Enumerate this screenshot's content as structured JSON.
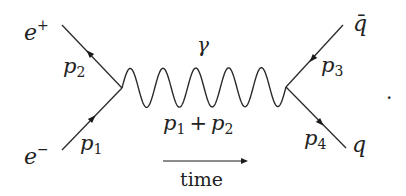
{
  "diagram": {
    "type": "feynman",
    "process": "e- e+ -> gamma -> q qbar",
    "particles": {
      "electron": {
        "label": "e",
        "sup": "−",
        "momentum": "p",
        "momentum_sub": "1"
      },
      "positron": {
        "label": "e",
        "sup": "+",
        "momentum": "p",
        "momentum_sub": "2"
      },
      "antiquark": {
        "label": "q̄",
        "momentum": "p",
        "momentum_sub": "3"
      },
      "quark": {
        "label": "q",
        "momentum": "p",
        "momentum_sub": "4"
      },
      "photon": {
        "label": "γ",
        "momentum_a": "p",
        "momentum_a_sub": "1",
        "plus": "+",
        "momentum_b": "p",
        "momentum_b_sub": "2",
        "oscillations": 5
      }
    },
    "time_label": "time",
    "trailing_punct": "."
  }
}
